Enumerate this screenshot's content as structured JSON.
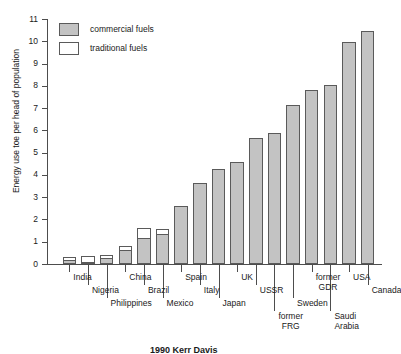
{
  "figure": {
    "caption_fragment": "1990 Kerr Davis"
  },
  "legend": {
    "position": "top-left",
    "entries": [
      {
        "label": "commercial fuels",
        "color": "#c3c3c3",
        "swatch": "filled-grey-square-icon"
      },
      {
        "label": "traditional fuels",
        "color": "#ffffff",
        "swatch": "empty-white-square-icon"
      }
    ]
  },
  "axes": {
    "ylabel": "Energy use toe per head of population",
    "xlabel": "",
    "yticks": [
      "0",
      "1",
      "2",
      "3",
      "4",
      "5",
      "6",
      "7",
      "8",
      "9",
      "10",
      "11"
    ],
    "ylim": [
      0,
      11
    ],
    "grid": false
  },
  "chart_data": {
    "type": "bar",
    "title": "",
    "subtitle": "",
    "xlabel": "",
    "ylabel": "Energy use toe per head of population",
    "ylim": [
      0,
      11
    ],
    "grid": false,
    "legend_position": "top-left",
    "stacked": true,
    "categories": [
      "India",
      "Nigeria",
      "Philippines",
      "China",
      "Brazil",
      "Mexico",
      "Spain",
      "Italy",
      "Japan",
      "UK",
      "USSR",
      "former FRG",
      "Sweden",
      "former GDR",
      "Saudi Arabia",
      "USA",
      "Canada"
    ],
    "series": [
      {
        "name": "commercial fuels",
        "color": "#c3c3c3",
        "values": [
          0.2,
          0.1,
          0.25,
          0.65,
          1.15,
          1.35,
          2.6,
          3.65,
          4.25,
          4.6,
          5.65,
          5.9,
          7.15,
          7.8,
          8.05,
          9.95,
          10.45
        ]
      },
      {
        "name": "traditional fuels",
        "color": "#ffffff",
        "values": [
          0.12,
          0.25,
          0.17,
          0.15,
          0.45,
          0.2,
          0,
          0,
          0,
          0,
          0,
          0,
          0,
          0,
          0,
          0,
          0
        ]
      }
    ],
    "totals": [
      0.32,
      0.35,
      0.42,
      0.8,
      1.6,
      1.55,
      2.6,
      3.65,
      4.25,
      4.6,
      5.65,
      5.9,
      7.15,
      7.8,
      8.05,
      9.95,
      10.45
    ]
  },
  "xlabels": [
    {
      "lines": [
        "India"
      ],
      "bar": 0,
      "row": 0
    },
    {
      "lines": [
        "Nigeria"
      ],
      "bar": 1,
      "row": 1
    },
    {
      "lines": [
        "Philippines"
      ],
      "bar": 2,
      "row": 2
    },
    {
      "lines": [
        "China"
      ],
      "bar": 3,
      "row": 0
    },
    {
      "lines": [
        "Brazil"
      ],
      "bar": 4,
      "row": 1
    },
    {
      "lines": [
        "Mexico"
      ],
      "bar": 5,
      "row": 2
    },
    {
      "lines": [
        "Spain"
      ],
      "bar": 6,
      "row": 0
    },
    {
      "lines": [
        "Italy"
      ],
      "bar": 7,
      "row": 1
    },
    {
      "lines": [
        "Japan"
      ],
      "bar": 8,
      "row": 2
    },
    {
      "lines": [
        "UK"
      ],
      "bar": 9,
      "row": 0
    },
    {
      "lines": [
        "USSR"
      ],
      "bar": 10,
      "row": 1
    },
    {
      "lines": [
        "former",
        "FRG"
      ],
      "bar": 11,
      "row": 3
    },
    {
      "lines": [
        "Sweden"
      ],
      "bar": 12,
      "row": 2
    },
    {
      "lines": [
        "former",
        "GDR"
      ],
      "bar": 13,
      "row": 0
    },
    {
      "lines": [
        "Saudi",
        "Arabia"
      ],
      "bar": 14,
      "row": 3
    },
    {
      "lines": [
        "USA"
      ],
      "bar": 15,
      "row": 0
    },
    {
      "lines": [
        "Canada"
      ],
      "bar": 16,
      "row": 1
    }
  ]
}
